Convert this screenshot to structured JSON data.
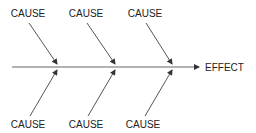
{
  "diagram": {
    "type": "fishbone",
    "effect": {
      "label": "EFFECT"
    },
    "causes_top": [
      {
        "label": "CAUSE"
      },
      {
        "label": "CAUSE"
      },
      {
        "label": "CAUSE"
      }
    ],
    "causes_bottom": [
      {
        "label": "CAUSE"
      },
      {
        "label": "CAUSE"
      },
      {
        "label": "CAUSE"
      }
    ],
    "colors": {
      "line": "#555555",
      "text": "#222222",
      "background": "#ffffff"
    }
  }
}
